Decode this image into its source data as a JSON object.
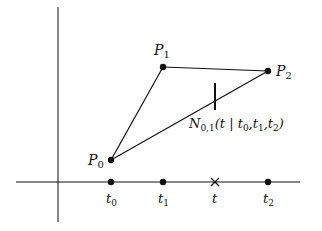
{
  "figure": {
    "stroke_color": "#111111",
    "background": "#ffffff",
    "points": [
      {
        "id": "P0",
        "label": "P",
        "sub": "0",
        "x": 111,
        "y": 160
      },
      {
        "id": "P1",
        "label": "P",
        "sub": "1",
        "x": 163,
        "y": 67
      },
      {
        "id": "P2",
        "label": "P",
        "sub": "2",
        "x": 268,
        "y": 71
      }
    ],
    "segment_label": {
      "main": "N",
      "sub": "0,1",
      "args": "(t | t",
      "a0": "0",
      "comma1": ",t",
      "a1": "1",
      "comma2": ",t",
      "a2": "2",
      "close": ")"
    },
    "axis_ticks": [
      {
        "label": "t",
        "sub": "0",
        "x": 111,
        "marker": "dot"
      },
      {
        "label": "t",
        "sub": "1",
        "x": 163,
        "marker": "dot"
      },
      {
        "label": "t",
        "sub": "",
        "x": 215,
        "marker": "cross"
      },
      {
        "label": "t",
        "sub": "2",
        "x": 268,
        "marker": "dot"
      }
    ]
  }
}
